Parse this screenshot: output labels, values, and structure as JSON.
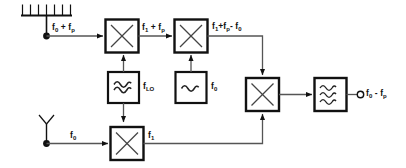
{
  "diagram": {
    "canvas": {
      "width": 406,
      "height": 168,
      "background": "#ffffff",
      "stroke": "#111111"
    },
    "sources": [
      {
        "name": "frequency-comb-source",
        "symbol": "comb",
        "teeth": 7,
        "label_html": "f<sub>0</sub> + f<sub>p</sub>",
        "label_text": "f0 + fp"
      },
      {
        "name": "antenna-source",
        "symbol": "antenna",
        "label_html": "f<sub>0</sub>",
        "label_text": "f0"
      }
    ],
    "blocks": [
      {
        "name": "mixer-1",
        "symbol": "x",
        "glyph": "multiplier"
      },
      {
        "name": "mixer-2",
        "symbol": "x",
        "glyph": "multiplier"
      },
      {
        "name": "mixer-3",
        "symbol": "x",
        "glyph": "multiplier"
      },
      {
        "name": "mixer-4",
        "symbol": "x",
        "glyph": "multiplier"
      },
      {
        "name": "oscillator-lo",
        "symbol": "sine",
        "glyph": "oscillator",
        "label_html": "f<sub>LO</sub>",
        "label_text": "fLO"
      },
      {
        "name": "oscillator-f0",
        "symbol": "sine",
        "glyph": "oscillator",
        "label_html": "f<sub>0</sub>",
        "label_text": "f0"
      },
      {
        "name": "filter-output",
        "symbol": "triple-sine",
        "glyph": "filter"
      }
    ],
    "signal_labels": [
      {
        "name": "label-comb-output",
        "html": "f<sub>0</sub> + f<sub>p</sub>",
        "text": "f0 + fp"
      },
      {
        "name": "label-mixer1-output",
        "html": "f<sub>1</sub> + f<sub>p</sub>",
        "text": "f1 + fp"
      },
      {
        "name": "label-mixer2-output",
        "html": "f<sub>1</sub>+f<sub>p</sub>- f<sub>0</sub>",
        "text": "f1+fp- f0"
      },
      {
        "name": "label-antenna-output",
        "html": "f<sub>0</sub>",
        "text": "f0"
      },
      {
        "name": "label-mixer4-output",
        "html": "f<sub>1</sub>",
        "text": "f1"
      },
      {
        "name": "label-final-output",
        "html": "f<sub>0</sub> - f<sub>p</sub>",
        "text": "f0 - fp"
      },
      {
        "name": "label-oscillator-lo",
        "html": "f<sub>LO</sub>",
        "text": "fLO"
      },
      {
        "name": "label-oscillator-f0",
        "html": "f<sub>0</sub>",
        "text": "f0"
      }
    ],
    "terminal": {
      "name": "output-terminal",
      "symbol": "open-circle"
    }
  }
}
